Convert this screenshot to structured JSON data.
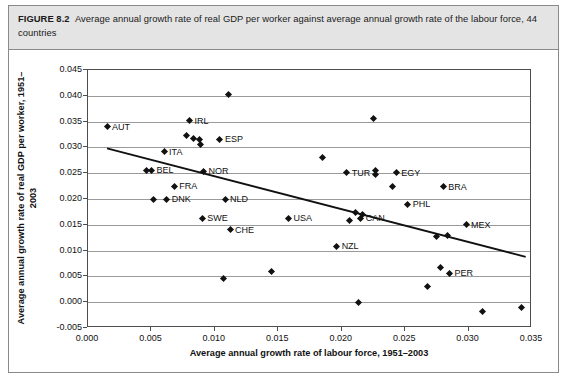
{
  "figure": {
    "label": "FIGURE 8.2",
    "caption": "Average annual growth rate of real GDP per worker against average annual growth rate of the labour force, 44 countries"
  },
  "chart_data": {
    "type": "scatter",
    "title": "Average annual growth rate of real GDP per worker against average annual growth rate of the labour force, 44 countries",
    "xlabel": "Average annual growth rate of labour force, 1951–2003",
    "ylabel": "Average annual growth rate of real GDP per worker, 1951–2003",
    "xlim": [
      0.0,
      0.035
    ],
    "ylim": [
      -0.005,
      0.045
    ],
    "xticks": [
      "0.000",
      "0.005",
      "0.010",
      "0.015",
      "0.020",
      "0.025",
      "0.030",
      "0.035"
    ],
    "xtick_values": [
      0.0,
      0.005,
      0.01,
      0.015,
      0.02,
      0.025,
      0.03,
      0.035
    ],
    "yticks": [
      "-0.005",
      "0.000",
      "0.005",
      "0.010",
      "0.015",
      "0.020",
      "0.025",
      "0.030",
      "0.035",
      "0.040",
      "0.045"
    ],
    "ytick_values": [
      -0.005,
      0.0,
      0.005,
      0.01,
      0.015,
      0.02,
      0.025,
      0.03,
      0.035,
      0.04,
      0.045
    ],
    "grid": "horizontal",
    "legend": "none",
    "marker": "diamond",
    "marker_color": "#111111",
    "trendline": {
      "label": "linear fit",
      "color": "#111111",
      "x0": 0.0015,
      "y0": 0.0298,
      "x1": 0.0345,
      "y1": 0.0088
    },
    "points": [
      {
        "label": "AUT",
        "x": 0.0015,
        "y": 0.034,
        "label_side": "right"
      },
      {
        "label": "IRL",
        "x": 0.008,
        "y": 0.0352,
        "label_side": "right"
      },
      {
        "label": "ITA",
        "x": 0.006,
        "y": 0.0292,
        "label_side": "right"
      },
      {
        "label": "BEL",
        "x": 0.005,
        "y": 0.0256,
        "label_side": "right"
      },
      {
        "label": "FRA",
        "x": 0.0068,
        "y": 0.0225,
        "label_side": "right"
      },
      {
        "label": "ESP",
        "x": 0.0104,
        "y": 0.0316,
        "label_side": "right"
      },
      {
        "label": "NOR",
        "x": 0.0091,
        "y": 0.0254,
        "label_side": "right"
      },
      {
        "label": "DNK",
        "x": 0.0062,
        "y": 0.02,
        "label_side": "right"
      },
      {
        "label": "NLD",
        "x": 0.0108,
        "y": 0.02,
        "label_side": "right"
      },
      {
        "label": "SWE",
        "x": 0.009,
        "y": 0.0163,
        "label_side": "right"
      },
      {
        "label": "CHE",
        "x": 0.0112,
        "y": 0.014,
        "label_side": "right"
      },
      {
        "label": "USA",
        "x": 0.0158,
        "y": 0.0163,
        "label_side": "right"
      },
      {
        "label": "NZL",
        "x": 0.0196,
        "y": 0.0108,
        "label_side": "right"
      },
      {
        "label": "TUR",
        "x": 0.0204,
        "y": 0.0251,
        "label_side": "right"
      },
      {
        "label": "CAN",
        "x": 0.0215,
        "y": 0.0163,
        "label_side": "right"
      },
      {
        "label": "EGY",
        "x": 0.0243,
        "y": 0.0251,
        "label_side": "right"
      },
      {
        "label": "BRA",
        "x": 0.028,
        "y": 0.0224,
        "label_side": "right"
      },
      {
        "label": "PHL",
        "x": 0.0252,
        "y": 0.019,
        "label_side": "right"
      },
      {
        "label": "MEX",
        "x": 0.0298,
        "y": 0.015,
        "label_side": "right"
      },
      {
        "label": "PER",
        "x": 0.0285,
        "y": 0.0056,
        "label_side": "right"
      },
      {
        "label": "",
        "x": 0.0078,
        "y": 0.0324,
        "label_side": "right"
      },
      {
        "label": "",
        "x": 0.0083,
        "y": 0.0318,
        "label_side": "right"
      },
      {
        "label": "",
        "x": 0.0111,
        "y": 0.0402,
        "label_side": "right"
      },
      {
        "label": "",
        "x": 0.0088,
        "y": 0.0316,
        "label_side": "right"
      },
      {
        "label": "",
        "x": 0.0089,
        "y": 0.0305,
        "label_side": "right"
      },
      {
        "label": "",
        "x": 0.0046,
        "y": 0.0255,
        "label_side": "right"
      },
      {
        "label": "",
        "x": 0.0052,
        "y": 0.02,
        "label_side": "right"
      },
      {
        "label": "",
        "x": 0.0107,
        "y": 0.0045,
        "label_side": "right"
      },
      {
        "label": "",
        "x": 0.0145,
        "y": 0.006,
        "label_side": "right"
      },
      {
        "label": "",
        "x": 0.0185,
        "y": 0.028,
        "label_side": "right"
      },
      {
        "label": "",
        "x": 0.0225,
        "y": 0.0356,
        "label_side": "right"
      },
      {
        "label": "",
        "x": 0.0227,
        "y": 0.0256,
        "label_side": "right"
      },
      {
        "label": "",
        "x": 0.0227,
        "y": 0.0247,
        "label_side": "right"
      },
      {
        "label": "",
        "x": 0.024,
        "y": 0.0224,
        "label_side": "right"
      },
      {
        "label": "",
        "x": 0.0211,
        "y": 0.0174,
        "label_side": "right"
      },
      {
        "label": "",
        "x": 0.0216,
        "y": 0.0169,
        "label_side": "right"
      },
      {
        "label": "",
        "x": 0.0206,
        "y": 0.0158,
        "label_side": "right"
      },
      {
        "label": "",
        "x": 0.0213,
        "y": 0.0,
        "label_side": "right"
      },
      {
        "label": "",
        "x": 0.0275,
        "y": 0.0128,
        "label_side": "right"
      },
      {
        "label": "",
        "x": 0.0283,
        "y": 0.013,
        "label_side": "right"
      },
      {
        "label": "",
        "x": 0.0278,
        "y": 0.0068,
        "label_side": "right"
      },
      {
        "label": "",
        "x": 0.0268,
        "y": 0.003,
        "label_side": "right"
      },
      {
        "label": "",
        "x": 0.0311,
        "y": -0.0018,
        "label_side": "right"
      },
      {
        "label": "",
        "x": 0.0342,
        "y": -0.001,
        "label_side": "right"
      }
    ]
  }
}
